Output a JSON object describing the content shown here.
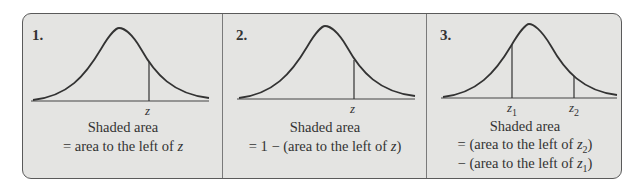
{
  "figure": {
    "panels": [
      {
        "number": "1.",
        "caption_line1": "Shaded area",
        "caption_line2": "= area to the left of z",
        "markers": [
          "z"
        ]
      },
      {
        "number": "2.",
        "caption_line1": "Shaded area",
        "caption_line2": "= 1 − (area to the left of z)",
        "markers": [
          "z"
        ]
      },
      {
        "number": "3.",
        "caption_line1": "Shaded area",
        "caption_line2": "= (area to the left of z₂)",
        "caption_line3": "− (area to the left of z₁)",
        "markers": [
          "z1",
          "z2"
        ]
      }
    ],
    "colors": {
      "background": "#e4e4e2",
      "border": "#5a5a5a",
      "curve": "#333333"
    }
  }
}
